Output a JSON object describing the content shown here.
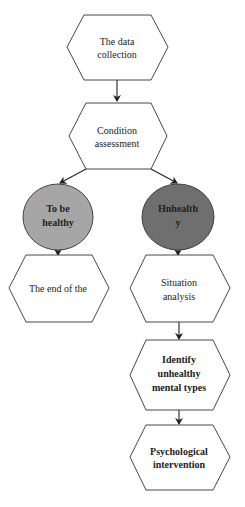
{
  "diagram": {
    "type": "flowchart",
    "nodes": [
      {
        "id": "data_collection",
        "shape": "hexagon",
        "lines": [
          "The data",
          "collection"
        ],
        "fill": "#ffffff"
      },
      {
        "id": "condition_assessment",
        "shape": "hexagon",
        "lines": [
          "Condition",
          "assessment"
        ],
        "fill": "#ffffff"
      },
      {
        "id": "to_be_healthy",
        "shape": "ellipse",
        "lines": [
          "To be",
          "healthy"
        ],
        "fill": "#a6a6a6"
      },
      {
        "id": "unhealthy",
        "shape": "ellipse",
        "lines": [
          "Hnhealth",
          "y"
        ],
        "fill": "#6f6f6f"
      },
      {
        "id": "end",
        "shape": "hexagon",
        "lines": [
          "The end of the"
        ],
        "fill": "#ffffff"
      },
      {
        "id": "situation_analysis",
        "shape": "hexagon",
        "lines": [
          "Situation",
          "analysis"
        ],
        "fill": "#ffffff"
      },
      {
        "id": "identify_types",
        "shape": "hexagon",
        "lines": [
          "Identify",
          "unhealthy",
          "mental types"
        ],
        "fill": "#ffffff"
      },
      {
        "id": "psych_intervention",
        "shape": "hexagon",
        "lines": [
          "Psychological",
          "intervention"
        ],
        "fill": "#ffffff"
      }
    ],
    "edges": [
      {
        "from": "data_collection",
        "to": "condition_assessment"
      },
      {
        "from": "condition_assessment",
        "to": "to_be_healthy"
      },
      {
        "from": "condition_assessment",
        "to": "unhealthy"
      },
      {
        "from": "to_be_healthy",
        "to": "end"
      },
      {
        "from": "unhealthy",
        "to": "situation_analysis"
      },
      {
        "from": "situation_analysis",
        "to": "identify_types"
      },
      {
        "from": "identify_types",
        "to": "psych_intervention"
      }
    ]
  },
  "labels": {
    "n1": {
      "l1": "The data",
      "l2": "collection"
    },
    "n2": {
      "l1": "Condition",
      "l2": "assessment"
    },
    "n3": {
      "l1": "To be",
      "l2": "healthy"
    },
    "n4": {
      "l1": "Hnhealth",
      "l2": "y"
    },
    "n5": {
      "l1": "The end of the"
    },
    "n6": {
      "l1": "Situation",
      "l2": "analysis"
    },
    "n7": {
      "l1": "Identify",
      "l2": "unhealthy",
      "l3": "mental types"
    },
    "n8": {
      "l1": "Psychological",
      "l2": "intervention"
    }
  }
}
